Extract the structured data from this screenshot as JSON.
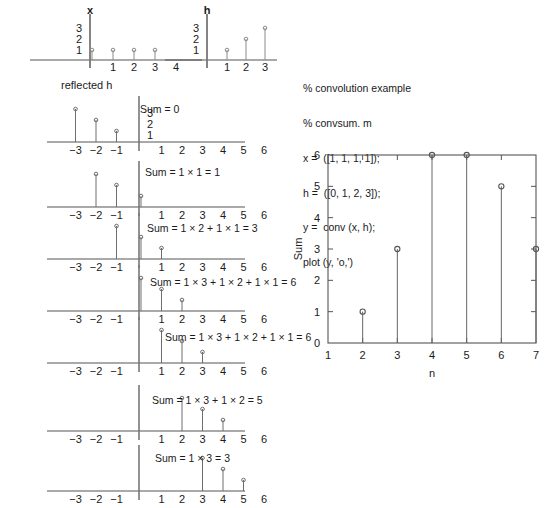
{
  "figure": {
    "top_plots": [
      {
        "name": "x",
        "title": "x",
        "stems": [
          {
            "pos": 0,
            "value": 1
          },
          {
            "pos": 1,
            "value": 1
          },
          {
            "pos": 2,
            "value": 1
          },
          {
            "pos": 3,
            "value": 1
          }
        ],
        "y_labels": [
          "3",
          "2",
          "1"
        ],
        "x_labels": [
          "1",
          "2",
          "3",
          "4"
        ]
      },
      {
        "name": "h",
        "title": "h",
        "stems": [
          {
            "pos": 1,
            "value": 1
          },
          {
            "pos": 2,
            "value": 2
          },
          {
            "pos": 3,
            "value": 3
          }
        ],
        "y_labels": [
          "3",
          "2",
          "1"
        ],
        "x_labels": [
          "1",
          "2",
          "3"
        ]
      }
    ],
    "reflected_label": "reflected h",
    "conv_rows": [
      {
        "index": 0,
        "y_labels": [
          "3",
          "2",
          "1"
        ],
        "stems": [
          {
            "pos": -3,
            "value": 3
          },
          {
            "pos": -2,
            "value": 2
          },
          {
            "pos": -1,
            "value": 1
          }
        ],
        "x_labels": [
          "−3",
          "−2",
          "−1",
          "1",
          "2",
          "3",
          "4",
          "5",
          "6"
        ],
        "sum_text": "Sum = 0"
      },
      {
        "index": 1,
        "y_labels": [],
        "stems": [
          {
            "pos": -2,
            "value": 3
          },
          {
            "pos": -1,
            "value": 2
          },
          {
            "pos": 0,
            "value": 1
          }
        ],
        "x_labels": [
          "−3",
          "−2",
          "−1",
          "1",
          "2",
          "3",
          "4",
          "5",
          "6"
        ],
        "sum_text": "Sum = 1 × 1 = 1"
      },
      {
        "index": 2,
        "y_labels": [],
        "stems": [
          {
            "pos": -1,
            "value": 3
          },
          {
            "pos": 0,
            "value": 2
          },
          {
            "pos": 1,
            "value": 1
          }
        ],
        "x_labels": [
          "−3",
          "−2",
          "−1",
          "1",
          "2",
          "3",
          "4",
          "5",
          "6"
        ],
        "sum_text": "Sum = 1 × 2 + 1 × 1 = 3"
      },
      {
        "index": 3,
        "y_labels": [],
        "stems": [
          {
            "pos": 0,
            "value": 3
          },
          {
            "pos": 1,
            "value": 2
          },
          {
            "pos": 2,
            "value": 1
          }
        ],
        "x_labels": [
          "−3",
          "−2",
          "−1",
          "1",
          "2",
          "3",
          "4",
          "5",
          "6"
        ],
        "sum_text": "Sum = 1 × 3 + 1 × 2 + 1 × 1 = 6"
      },
      {
        "index": 4,
        "y_labels": [],
        "stems": [
          {
            "pos": 1,
            "value": 3
          },
          {
            "pos": 2,
            "value": 2
          },
          {
            "pos": 3,
            "value": 1
          }
        ],
        "x_labels": [
          "−3",
          "−2",
          "−1",
          "1",
          "2",
          "3",
          "4",
          "5",
          "6"
        ],
        "sum_text": "Sum = 1 × 3 + 1 × 2  + 1 × 1 = 6"
      },
      {
        "index": 5,
        "y_labels": [],
        "stems": [
          {
            "pos": 2,
            "value": 3
          },
          {
            "pos": 3,
            "value": 2
          },
          {
            "pos": 4,
            "value": 1
          }
        ],
        "x_labels": [
          "−3",
          "−2",
          "−1",
          "1",
          "2",
          "3",
          "4",
          "5",
          "6"
        ],
        "sum_text": "Sum = 1 × 3 + 1 × 2  = 5"
      },
      {
        "index": 6,
        "y_labels": [],
        "stems": [
          {
            "pos": 3,
            "value": 3
          },
          {
            "pos": 4,
            "value": 2
          },
          {
            "pos": 5,
            "value": 1
          }
        ],
        "x_labels": [
          "−3",
          "−2",
          "−1",
          "1",
          "2",
          "3",
          "4",
          "5",
          "6"
        ],
        "sum_text": "Sum = 1 × 3 = 3"
      }
    ],
    "code_lines": [
      "% convolution example",
      "% convsum. m",
      "x =  ([1, 1, 1, 1]);",
      "h =  ([0, 1, 2, 3]);",
      "y =  conv (x, h);",
      "plot (y, 'o,')"
    ],
    "colors": {
      "axis": "#555555",
      "stem": "#6e6e6e",
      "text": "#1a1a1a",
      "frame": "#555555"
    }
  },
  "chart_data": {
    "type": "scatter",
    "title": "",
    "xlabel": "n",
    "ylabel": "Sum",
    "x": [
      2,
      3,
      4,
      5,
      6,
      7
    ],
    "values": [
      1,
      3,
      6,
      6,
      5,
      3
    ],
    "xlim": [
      1,
      7
    ],
    "ylim": [
      0,
      6
    ],
    "xticks": [
      1,
      2,
      3,
      4,
      5,
      6,
      7
    ],
    "yticks": [
      0,
      1,
      2,
      3,
      4,
      5,
      6
    ],
    "xtick_labels": [
      "1",
      "2",
      "3",
      "4",
      "5",
      "6",
      "7"
    ],
    "ytick_labels": [
      "0",
      "1",
      "2",
      "3",
      "4",
      "5",
      "6"
    ],
    "grid": false,
    "legend": null,
    "marker": "o",
    "series_name": "y = conv(x, h)"
  }
}
